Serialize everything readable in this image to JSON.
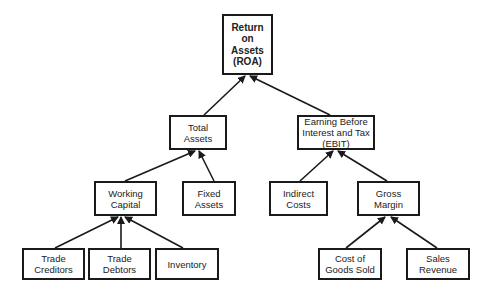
{
  "diagram": {
    "nodes": {
      "roa": {
        "label": "Return\non\nAssets\n(ROA)"
      },
      "total_assets": {
        "label": "Total\nAssets"
      },
      "ebit": {
        "label": "Earning Before\nInterest and Tax\n(EBIT)"
      },
      "working_capital": {
        "label": "Working\nCapital"
      },
      "fixed_assets": {
        "label": "Fixed\nAssets"
      },
      "indirect_costs": {
        "label": "Indirect\nCosts"
      },
      "gross_margin": {
        "label": "Gross\nMargin"
      },
      "trade_creditors": {
        "label": "Trade\nCreditors"
      },
      "trade_debtors": {
        "label": "Trade\nDebtors"
      },
      "inventory": {
        "label": "Inventory"
      },
      "cogs": {
        "label": "Cost of\nGoods Sold"
      },
      "sales_revenue": {
        "label": "Sales\nRevenue"
      }
    },
    "edges": [
      {
        "from": "total_assets",
        "to": "roa"
      },
      {
        "from": "ebit",
        "to": "roa"
      },
      {
        "from": "working_capital",
        "to": "total_assets"
      },
      {
        "from": "fixed_assets",
        "to": "total_assets"
      },
      {
        "from": "indirect_costs",
        "to": "ebit"
      },
      {
        "from": "gross_margin",
        "to": "ebit"
      },
      {
        "from": "trade_creditors",
        "to": "working_capital"
      },
      {
        "from": "trade_debtors",
        "to": "working_capital"
      },
      {
        "from": "inventory",
        "to": "working_capital"
      },
      {
        "from": "cogs",
        "to": "gross_margin"
      },
      {
        "from": "sales_revenue",
        "to": "gross_margin"
      }
    ],
    "colors": {
      "line": "#1a1a1a",
      "text": "#222222",
      "background": "#ffffff"
    }
  }
}
